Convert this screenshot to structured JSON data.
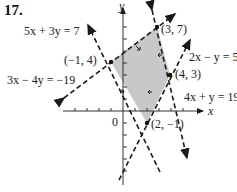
{
  "problem_number": "17.",
  "axes": {
    "x_label": "x",
    "y_label": "y",
    "origin_label": "0"
  },
  "lines": [
    {
      "equation": "5x + 3y = 7"
    },
    {
      "equation": "3x − 4y = −19"
    },
    {
      "equation": "2x − y = 5"
    },
    {
      "equation": "4x + y = 19"
    }
  ],
  "vertices": [
    {
      "label": "(−1, 4)",
      "x": -1,
      "y": 4
    },
    {
      "label": "(3, 7)",
      "x": 3,
      "y": 7
    },
    {
      "label": "(4, 3)",
      "x": 4,
      "y": 3
    },
    {
      "label": "(2, −1)",
      "x": 2,
      "y": -1
    }
  ],
  "colors": {
    "region_fill": "#c8c8c8",
    "line": "#1a1a1a"
  }
}
